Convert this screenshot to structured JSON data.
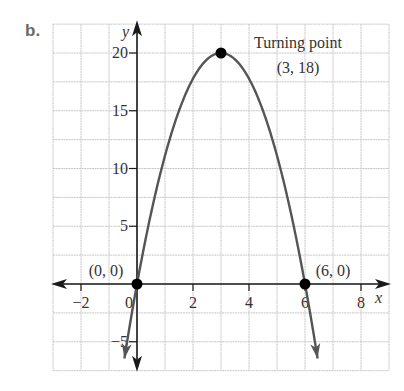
{
  "part_label": "b.",
  "chart_data": {
    "type": "line",
    "title": "",
    "xlabel": "x",
    "ylabel": "y",
    "xlim": [
      -3,
      9
    ],
    "ylim": [
      -7.5,
      22.5
    ],
    "grid": true,
    "grid_x_step": 1,
    "grid_y_step": 2.5,
    "x_ticks": [
      -2,
      0,
      2,
      4,
      6,
      8
    ],
    "x_tick_labels": [
      "−2",
      "0",
      "2",
      "4",
      "6",
      "8"
    ],
    "y_ticks": [
      -5,
      5,
      10,
      15,
      20
    ],
    "y_tick_labels": [
      "−5",
      "5",
      "10",
      "15",
      "20"
    ],
    "series": [
      {
        "name": "parabola",
        "equation_plotted": "y = -(20/9) x (x - 6)",
        "x_range": [
          -0.45,
          6.45
        ],
        "color": "#555555",
        "arrows_both_ends": true
      }
    ],
    "points": [
      {
        "name": "origin-point",
        "x": 0,
        "y": 0,
        "label": "(0, 0)"
      },
      {
        "name": "x-intercept-point",
        "x": 6,
        "y": 0,
        "label": "(6, 0)"
      },
      {
        "name": "turning-point",
        "x": 3,
        "y": 20,
        "label": "(3, 18)"
      }
    ],
    "annotations": [
      {
        "text": "Turning point",
        "near": "turning-point"
      },
      {
        "text": "(3, 18)",
        "near": "turning-point"
      },
      {
        "text": "(0, 0)",
        "near": "origin-point"
      },
      {
        "text": "(6, 0)",
        "near": "x-intercept-point"
      }
    ],
    "legend": null
  },
  "colors": {
    "grid": "#c8c8c8",
    "axis": "#1a1a1a",
    "curve": "#555555",
    "point": "#000000",
    "part_label": "#6b6b6b"
  }
}
